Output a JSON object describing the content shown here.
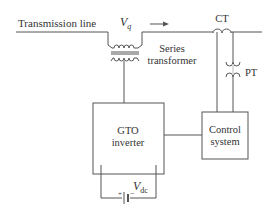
{
  "diagram": {
    "labels": {
      "transmission_line": "Transmission line",
      "vq_main": "V",
      "vq_sub": "q",
      "series_transformer_1": "Series",
      "series_transformer_2": "transformer",
      "ct": "CT",
      "pt": "PT",
      "gto_1": "GTO",
      "gto_2": "inverter",
      "control_1": "Control",
      "control_2": "system",
      "vdc_main": "V",
      "vdc_sub": "dc",
      "battery_plus": "+",
      "battery_minus": "−"
    },
    "colors": {
      "line": "#555555",
      "text": "#333333",
      "background": "#ffffff"
    },
    "components": [
      {
        "id": "transmission-line",
        "type": "line"
      },
      {
        "id": "series-transformer",
        "type": "transformer"
      },
      {
        "id": "ct",
        "type": "current-transformer"
      },
      {
        "id": "pt",
        "type": "potential-transformer"
      },
      {
        "id": "gto-inverter",
        "type": "block"
      },
      {
        "id": "control-system",
        "type": "block"
      },
      {
        "id": "dc-source",
        "type": "battery"
      }
    ],
    "connections": [
      [
        "transmission-line",
        "series-transformer"
      ],
      [
        "series-transformer",
        "gto-inverter"
      ],
      [
        "ct",
        "control-system"
      ],
      [
        "pt",
        "control-system"
      ],
      [
        "control-system",
        "gto-inverter"
      ],
      [
        "dc-source",
        "gto-inverter"
      ]
    ]
  }
}
